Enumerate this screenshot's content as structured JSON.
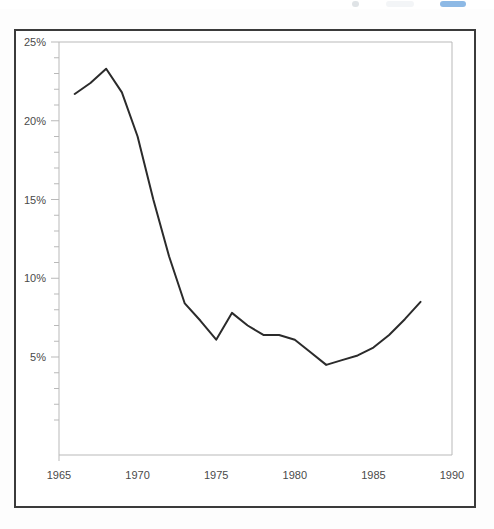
{
  "page": {
    "background_color": "#fdfdfd",
    "frame_color": "#3b3b3b",
    "top_strip": {
      "note": "cut-off UI sliver at top edge of scan",
      "accent_color": "#2f7fd0"
    }
  },
  "chart_data": {
    "type": "line",
    "title": "",
    "subtitle": "",
    "xlabel": "",
    "ylabel": "",
    "xlim": [
      1965,
      1990
    ],
    "ylim": [
      0,
      25
    ],
    "grid": false,
    "legend": null,
    "axis_color": "#b9b9b9",
    "line_color": "#2b2b2b",
    "x_ticks": [
      1965,
      1970,
      1975,
      1980,
      1985,
      1990
    ],
    "x_tick_labels": [
      "1965",
      "1970",
      "1975",
      "1980",
      "1985",
      "1990"
    ],
    "y_ticks": [
      5,
      10,
      15,
      20,
      25
    ],
    "y_tick_labels": [
      "5%",
      "10%",
      "15%",
      "20%",
      "25%"
    ],
    "y_minor_tick_step": 1,
    "x": [
      1966,
      1967,
      1968,
      1969,
      1970,
      1971,
      1972,
      1973,
      1974,
      1975,
      1976,
      1977,
      1978,
      1979,
      1980,
      1981,
      1982,
      1983,
      1984,
      1985,
      1986,
      1987,
      1988
    ],
    "values": [
      21.7,
      22.4,
      23.3,
      21.8,
      19.0,
      15.0,
      11.4,
      8.4,
      7.3,
      6.1,
      7.8,
      7.0,
      6.4,
      6.4,
      6.1,
      5.3,
      4.5,
      4.8,
      5.1,
      5.6,
      6.4,
      7.4,
      8.5
    ],
    "series": [
      {
        "name": "series-1",
        "values": [
          21.7,
          22.4,
          23.3,
          21.8,
          19.0,
          15.0,
          11.4,
          8.4,
          7.3,
          6.1,
          7.8,
          7.0,
          6.4,
          6.4,
          6.1,
          5.3,
          4.5,
          4.8,
          5.1,
          5.6,
          6.4,
          7.4,
          8.5
        ]
      }
    ]
  }
}
